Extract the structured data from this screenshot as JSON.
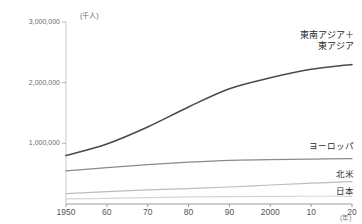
{
  "chart_data": {
    "type": "line",
    "title": "",
    "xlabel": "(年)",
    "ylabel": "(千人)",
    "yunit": "(千人)",
    "xunit": "(年)",
    "xlim": [
      1950,
      2020
    ],
    "ylim": [
      0,
      3000000
    ],
    "yticks": [
      {
        "value": 3000000,
        "label": "3,000,000"
      },
      {
        "value": 2000000,
        "label": "2,000,000"
      },
      {
        "value": 1000000,
        "label": "1,000,000"
      }
    ],
    "xticks": [
      {
        "value": 1950,
        "label": "1950"
      },
      {
        "value": 1960,
        "label": "60"
      },
      {
        "value": 1970,
        "label": "70"
      },
      {
        "value": 1980,
        "label": "80"
      },
      {
        "value": 1990,
        "label": "90"
      },
      {
        "value": 2000,
        "label": "2000"
      },
      {
        "value": 2010,
        "label": "10"
      },
      {
        "value": 2020,
        "label": "20"
      }
    ],
    "grid": false,
    "legend_position": "inline-right",
    "x": [
      1950,
      1960,
      1970,
      1980,
      1990,
      2000,
      2010,
      2020
    ],
    "series": [
      {
        "name": "東南アジア＋東アジア",
        "color": "#4a4a4a",
        "width": 1.6,
        "label_lines": [
          "東南アジア＋",
          "東アジア"
        ],
        "values": [
          800000,
          990000,
          1270000,
          1600000,
          1900000,
          2080000,
          2220000,
          2300000
        ]
      },
      {
        "name": "ヨーロッパ",
        "color": "#8a8a8a",
        "width": 1.3,
        "label_lines": [
          "ヨーロッパ"
        ],
        "values": [
          545000,
          600000,
          650000,
          690000,
          720000,
          730000,
          740000,
          748000
        ]
      },
      {
        "name": "北米",
        "color": "#bdbdbd",
        "width": 1.2,
        "label_lines": [
          "北米"
        ],
        "values": [
          172000,
          205000,
          232000,
          255000,
          280000,
          313000,
          343000,
          370000
        ]
      },
      {
        "name": "日本",
        "color": "#d6d6d6",
        "width": 1.2,
        "label_lines": [
          "日本"
        ],
        "values": [
          83000,
          94000,
          104000,
          117000,
          123000,
          126000,
          128000,
          126000
        ]
      }
    ]
  },
  "axes": {
    "y_unit_label": "(千人)",
    "x_unit_label": "(年)"
  }
}
